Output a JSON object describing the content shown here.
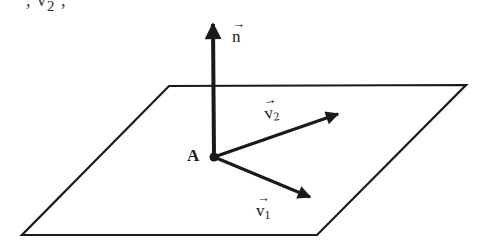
{
  "figure": {
    "cropped_top_text": ", v",
    "cropped_top_subscript": "2",
    "cropped_top_tail": " ,",
    "colors": {
      "line": "#1a1a1a",
      "background": "#ffffff"
    },
    "plane": {
      "shape": "parallelogram",
      "vertices": [
        [
          169,
          86
        ],
        [
          466,
          85
        ],
        [
          317,
          235
        ],
        [
          22,
          235
        ]
      ]
    },
    "point": {
      "label": "A",
      "x": 214,
      "y": 157
    },
    "vectors": [
      {
        "name": "n",
        "arrow": "→",
        "symbol": "n",
        "subscript": "",
        "from": [
          214,
          157
        ],
        "to": [
          213,
          20
        ],
        "description": "normal vector"
      },
      {
        "name": "v2",
        "arrow": "→",
        "symbol": "v",
        "subscript": "2",
        "from": [
          214,
          157
        ],
        "to": [
          342,
          113
        ],
        "description": "direction vector 2"
      },
      {
        "name": "v1",
        "arrow": "→",
        "symbol": "v",
        "subscript": "1",
        "from": [
          214,
          157
        ],
        "to": [
          314,
          198
        ],
        "description": "direction vector 1"
      }
    ]
  }
}
